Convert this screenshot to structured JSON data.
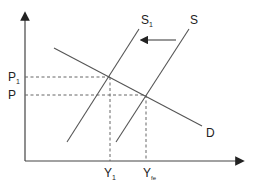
{
  "diagram": {
    "type": "supply-demand",
    "axes": {
      "y_label": "",
      "x_label": ""
    },
    "curves": {
      "demand": {
        "label": "D"
      },
      "supply_original": {
        "label": "S"
      },
      "supply_shifted": {
        "label": "S",
        "subscript": "1"
      }
    },
    "price_levels": [
      {
        "label": "P",
        "subscript": "1"
      },
      {
        "label": "P",
        "subscript": ""
      }
    ],
    "output_levels": [
      {
        "label": "Y",
        "subscript": "1"
      },
      {
        "label": "Y",
        "subscript": "fe"
      }
    ],
    "shift_arrow": {
      "direction": "left",
      "from": "S",
      "to": "S1"
    },
    "colors": {
      "line": "#555555",
      "axis": "#333333",
      "text": "#222222"
    }
  }
}
